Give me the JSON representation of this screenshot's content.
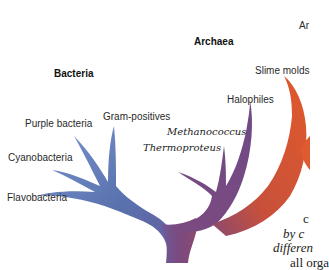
{
  "groups": {
    "bacteria": "Bacteria",
    "archaea": "Archaea",
    "eukarya_partial": "Ar"
  },
  "bacteria_labels": {
    "purple_bacteria": "Purple bacteria",
    "gram_positives": "Gram-positives",
    "cyanobacteria": "Cyanobacteria",
    "flavobacteria": "Flavobacteria"
  },
  "archaea_labels": {
    "halophiles": "Halophiles",
    "methanococcus": "Methanococcus",
    "thermoproteus": "Thermoproteus"
  },
  "eukarya_labels": {
    "slime_molds": "Slime molds"
  },
  "caption_fragments": {
    "line1": "c",
    "line2": "by c",
    "line3": "differen",
    "line4": "all orga"
  },
  "colors": {
    "bacteria_branch": "#5a74b0",
    "archaea_branch": "#7a4a82",
    "eukarya_branch": "#d8502c",
    "trunk": "#7a4a7e"
  }
}
